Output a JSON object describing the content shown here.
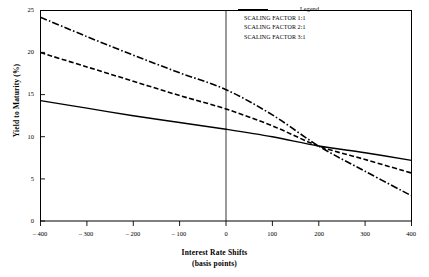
{
  "chart_data": {
    "type": "line",
    "title": "",
    "xlabel": "Interest Rate Shifts",
    "xlabel_sub": "(basis points)",
    "ylabel": "Yield to Maturity (%)",
    "xlim": [
      -400,
      400
    ],
    "ylim": [
      0,
      25
    ],
    "grid": false,
    "legend_position": "top-right",
    "legend_title": "Legend",
    "xticks": [
      -400,
      -300,
      -200,
      -100,
      0,
      100,
      200,
      300,
      400
    ],
    "xtick_labels": [
      "– 400",
      "– 300",
      "– 200",
      "– 100",
      "0",
      "100",
      "200",
      "300",
      "400"
    ],
    "yticks": [
      0,
      5,
      10,
      15,
      20,
      25
    ],
    "ytick_labels": [
      "0",
      "5",
      "10",
      "15",
      "20",
      "25"
    ],
    "x": [
      -400,
      -300,
      -200,
      -100,
      0,
      100,
      200,
      300,
      400
    ],
    "series": [
      {
        "name": "SCALING FACTOR 1:1",
        "style": "solid",
        "values": [
          14.3,
          13.4,
          12.5,
          11.7,
          10.9,
          10.0,
          8.9,
          8.1,
          7.2
        ]
      },
      {
        "name": "SCALING FACTOR 2:1",
        "style": "dashed",
        "values": [
          20.0,
          18.3,
          16.6,
          14.9,
          13.3,
          11.3,
          8.9,
          7.3,
          5.7
        ]
      },
      {
        "name": "SCALING FACTOR 3:1",
        "style": "dash-dot",
        "values": [
          24.2,
          21.9,
          19.7,
          17.6,
          15.6,
          12.6,
          8.9,
          5.9,
          3.0
        ]
      }
    ],
    "annotations": [
      {
        "label": "zero-shift-reference-line",
        "x": 0
      }
    ],
    "colors": {
      "line": "#000000",
      "frame": "#000000",
      "background": "#ffffff"
    }
  }
}
